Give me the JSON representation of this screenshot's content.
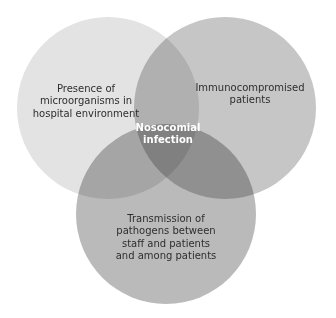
{
  "diagram": {
    "type": "venn",
    "circles": [
      {
        "id": "left",
        "label": "Presence of\nmicroorganisms in\nhospital environment",
        "cx": 108,
        "cy": 108,
        "r": 91,
        "fill": "#d9d9d9"
      },
      {
        "id": "right",
        "label": "Immunocompromised\npatients",
        "cx": 225,
        "cy": 108,
        "r": 91,
        "fill": "#b3b3b3"
      },
      {
        "id": "bottom",
        "label": "Transmission of\npathogens between\nstaff and patients\nand among patients",
        "cx": 166,
        "cy": 214,
        "r": 90,
        "fill": "#a6a6a6"
      }
    ],
    "intersection": {
      "label": "Nosocomial\ninfection"
    },
    "colors": {
      "background": "#ffffff",
      "text": "#2e2e2e",
      "center_text": "#ffffff"
    }
  }
}
